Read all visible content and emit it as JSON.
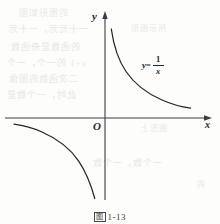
{
  "figure": {
    "caption_mark": "图",
    "caption_number": "1-13",
    "axes": {
      "y_axis_label": "y",
      "x_axis_label": "x",
      "origin_label": "O"
    },
    "curve_label": {
      "lhs": "y=",
      "numerator": "1",
      "denominator": "x",
      "full_text": "y = 1/x"
    },
    "colors": {
      "ink": "#272727",
      "paper": "#fdfdfb",
      "ghost_text": "#e9e7e4"
    }
  },
  "chart_data": {
    "type": "line",
    "title": "",
    "subtitle": "",
    "xlabel": "x",
    "ylabel": "y",
    "grid": false,
    "legend": null,
    "annotations": [
      "y = 1/x",
      "O"
    ],
    "xlim": [
      -5.7,
      6.0
    ],
    "ylim": [
      -5.3,
      6.1
    ],
    "origin_px": [
      105,
      118
    ],
    "series": [
      {
        "name": "y = 1/x (branch x > 0)",
        "x": [
          0.35,
          0.4,
          0.5,
          0.6,
          0.75,
          0.9,
          1.1,
          1.3,
          1.6,
          2.0,
          2.5,
          3.0,
          3.5,
          4.0,
          4.5,
          4.95
        ],
        "y": [
          2.86,
          2.5,
          2.0,
          1.67,
          1.33,
          1.11,
          0.91,
          0.77,
          0.63,
          0.5,
          0.4,
          0.33,
          0.29,
          0.25,
          0.22,
          0.2
        ]
      },
      {
        "name": "y = 1/x (branch x < 0)",
        "x": [
          -5.1,
          -4.5,
          -4.0,
          -3.5,
          -3.0,
          -2.5,
          -2.0,
          -1.6,
          -1.3,
          -1.1,
          -0.9,
          -0.75,
          -0.65,
          -0.58
        ],
        "y": [
          -0.2,
          -0.22,
          -0.25,
          -0.29,
          -0.33,
          -0.4,
          -0.5,
          -0.63,
          -0.77,
          -0.91,
          -1.11,
          -1.33,
          -1.54,
          -1.72
        ]
      }
    ]
  },
  "ghost_text": {
    "lines": [
      {
        "text": "的图形如图",
        "left": 18,
        "top": 6,
        "size": 9
      },
      {
        "text": "一十元元，一十元",
        "left": 8,
        "top": 22,
        "size": 9
      },
      {
        "text": "所示图形",
        "left": 130,
        "top": 22,
        "size": 8
      },
      {
        "text": "的函数是奇函数",
        "left": 10,
        "top": 40,
        "size": 9
      },
      {
        "text": "x+1 的一个，一个",
        "left": 6,
        "top": 56,
        "size": 9
      },
      {
        "text": "二次函数的图像",
        "left": 8,
        "top": 72,
        "size": 9
      },
      {
        "text": "此时，一个数是",
        "left": 6,
        "top": 88,
        "size": 9
      },
      {
        "text": "图形上",
        "left": 140,
        "top": 122,
        "size": 8
      },
      {
        "text": "一个数，一个数",
        "left": 92,
        "top": 156,
        "size": 9
      },
      {
        "text": "的",
        "left": 196,
        "top": 178,
        "size": 8
      }
    ]
  }
}
